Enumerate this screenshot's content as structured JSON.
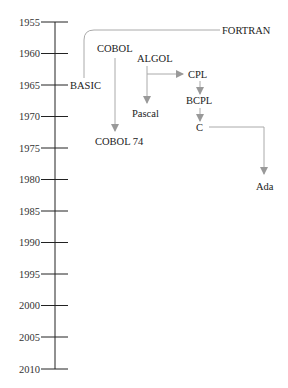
{
  "diagram": {
    "axis": {
      "years": [
        "1955",
        "1960",
        "1965",
        "1970",
        "1975",
        "1980",
        "1985",
        "1990",
        "1995",
        "2000",
        "2005",
        "2010"
      ]
    },
    "nodes": {
      "fortran": "FORTRAN",
      "cobol": "COBOL",
      "algol": "ALGOL",
      "basic": "BASIC",
      "cpl": "CPL",
      "pascal": "Pascal",
      "bcpl": "BCPL",
      "c": "C",
      "cobol74": "COBOL 74",
      "ada": "Ada"
    },
    "edges": [
      {
        "from": "FORTRAN",
        "to": "BASIC"
      },
      {
        "from": "COBOL",
        "to": "COBOL 74"
      },
      {
        "from": "ALGOL",
        "to": "Pascal"
      },
      {
        "from": "ALGOL",
        "to": "CPL"
      },
      {
        "from": "CPL",
        "to": "BCPL"
      },
      {
        "from": "BCPL",
        "to": "C"
      },
      {
        "from": "C",
        "to": "Ada"
      }
    ],
    "colors": {
      "axis": "#222222",
      "connector": "#aaaaaa",
      "arrowhead": "#999999"
    }
  }
}
